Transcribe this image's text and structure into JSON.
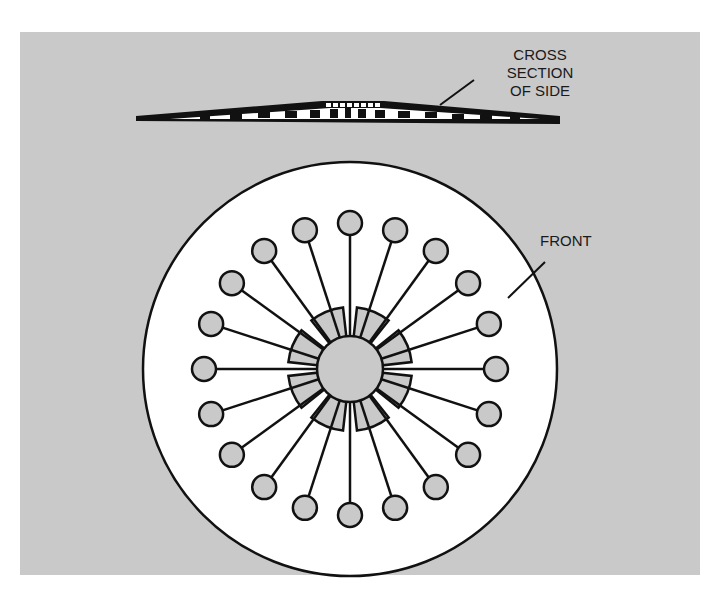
{
  "figure": {
    "type": "technical-illustration",
    "background_color": "#c9c9c9",
    "disc_color": "#ffffff",
    "hub_color": "#c9c9c9",
    "stroke_color": "#111111",
    "spoke_count": 20
  },
  "labels": {
    "cross_section_line1": "CROSS",
    "cross_section_line2": "SECTION",
    "cross_section_line3": "OF SIDE",
    "front": "FRONT"
  }
}
